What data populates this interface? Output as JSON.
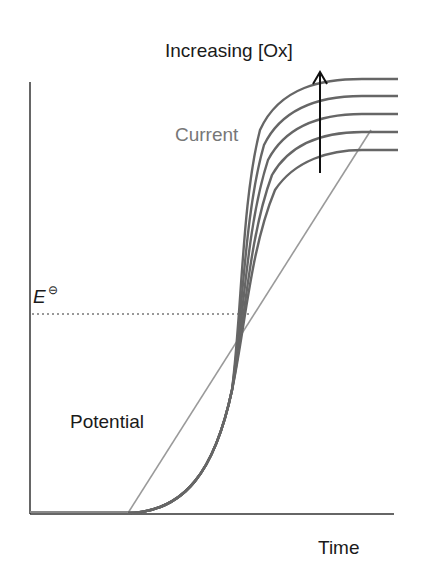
{
  "diagram": {
    "title": "Increasing [Ox]",
    "labels": {
      "current": "Current",
      "potential": "Potential",
      "x_axis": "Time",
      "standard_potential": "E",
      "standard_potential_symbol": "⊖"
    },
    "colors": {
      "axes": "#333333",
      "current_curves": "#666666",
      "potential_line": "#9a9a9a",
      "text": "#1a1a1a",
      "current_label": "#777777"
    },
    "curves": {
      "count": 5,
      "description": "Sigmoidal current vs time curves, plateau rises with increasing [Ox]"
    }
  }
}
